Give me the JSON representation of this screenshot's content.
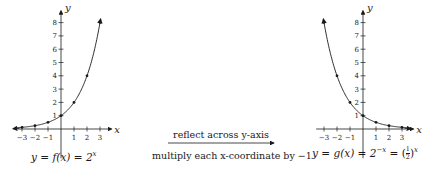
{
  "left_graph": {
    "caption_prefix": "y = f(x) = 2",
    "caption_exp": "x",
    "x_axis_label": "x",
    "y_axis_label": "y",
    "x_ticks": [
      "−3",
      "−2",
      "−1",
      "1",
      "2",
      "3"
    ],
    "y_ticks": [
      "1",
      "2",
      "3",
      "4",
      "5",
      "6",
      "7",
      "8"
    ]
  },
  "right_graph": {
    "caption_prefix": "y = g(x) = 2",
    "caption_exp": "−x",
    "caption_eq": " = ",
    "frac_num": "1",
    "frac_den": "2",
    "caption_exp2": "x",
    "x_axis_label": "x",
    "y_axis_label": "y",
    "x_ticks": [
      "−3",
      "−2",
      "−1",
      "1",
      "2",
      "3"
    ],
    "y_ticks": [
      "1",
      "2",
      "3",
      "4",
      "5",
      "6",
      "7",
      "8"
    ]
  },
  "transformation": {
    "top_text": "reflect across y-axis",
    "bottom_text": "multiply each x-coordinate by −1"
  },
  "chart_data": [
    {
      "type": "line",
      "title": "y = f(x) = 2^x",
      "xlabel": "x",
      "ylabel": "y",
      "x": [
        -3,
        -2,
        -1,
        0,
        1,
        2,
        3
      ],
      "values": [
        0.125,
        0.25,
        0.5,
        1,
        2,
        4,
        8
      ],
      "xlim": [
        -3.5,
        3.5
      ],
      "ylim": [
        0,
        8.5
      ],
      "grid": false
    },
    {
      "type": "line",
      "title": "y = g(x) = 2^(-x) = (1/2)^x",
      "xlabel": "x",
      "ylabel": "y",
      "x": [
        -3,
        -2,
        -1,
        0,
        1,
        2,
        3
      ],
      "values": [
        8,
        4,
        2,
        1,
        0.5,
        0.25,
        0.125
      ],
      "xlim": [
        -3.5,
        3.5
      ],
      "ylim": [
        0,
        8.5
      ],
      "grid": false
    }
  ]
}
